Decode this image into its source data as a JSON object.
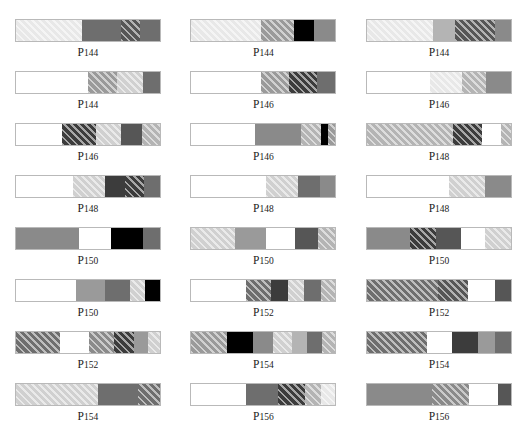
{
  "figure": {
    "corner_mark": "",
    "columns": 3,
    "rows": 8,
    "bar_width_px": 146,
    "bar_height_px": 23
  },
  "palette": {
    "white": "#ffffff",
    "very_light_gray": "#e8e8e8",
    "light_gray": "#d0d0d0",
    "mid_light_gray": "#b4b4b4",
    "mid_gray": "#9a9a9a",
    "gray": "#8a8a8a",
    "dark_gray": "#6e6e6e",
    "darker_gray": "#565656",
    "very_dark_gray": "#3c3c3c",
    "black": "#000000",
    "border": "#b9b9b9",
    "hatch_line": "rgba(255,255,255,0.55)"
  },
  "chart_data": {
    "type": "bar",
    "title": "",
    "xlabel": "",
    "ylabel": "",
    "legend": [],
    "grid": false,
    "items": [
      {
        "label_prefix": "P",
        "label_number": "144",
        "row": 1,
        "col": 1,
        "segments": [
          {
            "width_pct": 46,
            "fill": "very_light_gray",
            "hatch": true
          },
          {
            "width_pct": 27,
            "fill": "dark_gray",
            "hatch": false
          },
          {
            "width_pct": 13,
            "fill": "darker_gray",
            "hatch": true
          },
          {
            "width_pct": 14,
            "fill": "dark_gray",
            "hatch": false
          }
        ]
      },
      {
        "label_prefix": "P",
        "label_number": "144",
        "row": 1,
        "col": 2,
        "segments": [
          {
            "width_pct": 48,
            "fill": "very_light_gray",
            "hatch": true
          },
          {
            "width_pct": 23,
            "fill": "mid_gray",
            "hatch": true
          },
          {
            "width_pct": 14,
            "fill": "black",
            "hatch": false
          },
          {
            "width_pct": 15,
            "fill": "gray",
            "hatch": false
          }
        ]
      },
      {
        "label_prefix": "P",
        "label_number": "144",
        "row": 1,
        "col": 3,
        "segments": [
          {
            "width_pct": 46,
            "fill": "very_light_gray",
            "hatch": true
          },
          {
            "width_pct": 15,
            "fill": "mid_light_gray",
            "hatch": false
          },
          {
            "width_pct": 28,
            "fill": "darker_gray",
            "hatch": true
          },
          {
            "width_pct": 11,
            "fill": "gray",
            "hatch": false
          }
        ]
      },
      {
        "label_prefix": "P",
        "label_number": "144",
        "row": 2,
        "col": 1,
        "segments": [
          {
            "width_pct": 50,
            "fill": "white",
            "hatch": false
          },
          {
            "width_pct": 20,
            "fill": "mid_gray",
            "hatch": true
          },
          {
            "width_pct": 18,
            "fill": "light_gray",
            "hatch": true
          },
          {
            "width_pct": 12,
            "fill": "dark_gray",
            "hatch": false
          }
        ]
      },
      {
        "label_prefix": "P",
        "label_number": "146",
        "row": 2,
        "col": 2,
        "segments": [
          {
            "width_pct": 48,
            "fill": "white",
            "hatch": false
          },
          {
            "width_pct": 20,
            "fill": "mid_gray",
            "hatch": true
          },
          {
            "width_pct": 19,
            "fill": "very_dark_gray",
            "hatch": true
          },
          {
            "width_pct": 13,
            "fill": "dark_gray",
            "hatch": false
          }
        ]
      },
      {
        "label_prefix": "P",
        "label_number": "146",
        "row": 2,
        "col": 3,
        "segments": [
          {
            "width_pct": 44,
            "fill": "white",
            "hatch": false
          },
          {
            "width_pct": 22,
            "fill": "very_light_gray",
            "hatch": true
          },
          {
            "width_pct": 17,
            "fill": "mid_light_gray",
            "hatch": true
          },
          {
            "width_pct": 17,
            "fill": "gray",
            "hatch": false
          }
        ]
      },
      {
        "label_prefix": "P",
        "label_number": "146",
        "row": 3,
        "col": 1,
        "segments": [
          {
            "width_pct": 32,
            "fill": "white",
            "hatch": false
          },
          {
            "width_pct": 24,
            "fill": "very_dark_gray",
            "hatch": true
          },
          {
            "width_pct": 17,
            "fill": "light_gray",
            "hatch": true
          },
          {
            "width_pct": 15,
            "fill": "darker_gray",
            "hatch": false
          },
          {
            "width_pct": 12,
            "fill": "mid_light_gray",
            "hatch": true
          }
        ]
      },
      {
        "label_prefix": "P",
        "label_number": "146",
        "row": 3,
        "col": 2,
        "segments": [
          {
            "width_pct": 44,
            "fill": "white",
            "hatch": false
          },
          {
            "width_pct": 32,
            "fill": "gray",
            "hatch": false
          },
          {
            "width_pct": 14,
            "fill": "mid_light_gray",
            "hatch": true
          },
          {
            "width_pct": 5,
            "fill": "black",
            "hatch": false
          },
          {
            "width_pct": 5,
            "fill": "mid_gray",
            "hatch": true
          }
        ]
      },
      {
        "label_prefix": "P",
        "label_number": "148",
        "row": 3,
        "col": 3,
        "segments": [
          {
            "width_pct": 60,
            "fill": "mid_light_gray",
            "hatch": true
          },
          {
            "width_pct": 20,
            "fill": "very_dark_gray",
            "hatch": true
          },
          {
            "width_pct": 13,
            "fill": "white",
            "hatch": false
          },
          {
            "width_pct": 7,
            "fill": "mid_light_gray",
            "hatch": true
          }
        ]
      },
      {
        "label_prefix": "P",
        "label_number": "148",
        "row": 4,
        "col": 1,
        "segments": [
          {
            "width_pct": 40,
            "fill": "white",
            "hatch": false
          },
          {
            "width_pct": 22,
            "fill": "light_gray",
            "hatch": true
          },
          {
            "width_pct": 14,
            "fill": "very_dark_gray",
            "hatch": false
          },
          {
            "width_pct": 13,
            "fill": "very_dark_gray",
            "hatch": true
          },
          {
            "width_pct": 11,
            "fill": "dark_gray",
            "hatch": false
          }
        ]
      },
      {
        "label_prefix": "P",
        "label_number": "148",
        "row": 4,
        "col": 2,
        "segments": [
          {
            "width_pct": 52,
            "fill": "white",
            "hatch": false
          },
          {
            "width_pct": 22,
            "fill": "light_gray",
            "hatch": true
          },
          {
            "width_pct": 15,
            "fill": "dark_gray",
            "hatch": false
          },
          {
            "width_pct": 11,
            "fill": "gray",
            "hatch": false
          }
        ]
      },
      {
        "label_prefix": "P",
        "label_number": "148",
        "row": 4,
        "col": 3,
        "segments": [
          {
            "width_pct": 57,
            "fill": "white",
            "hatch": false
          },
          {
            "width_pct": 25,
            "fill": "light_gray",
            "hatch": true
          },
          {
            "width_pct": 18,
            "fill": "gray",
            "hatch": false
          }
        ]
      },
      {
        "label_prefix": "P",
        "label_number": "150",
        "row": 5,
        "col": 1,
        "segments": [
          {
            "width_pct": 44,
            "fill": "gray",
            "hatch": false
          },
          {
            "width_pct": 22,
            "fill": "white",
            "hatch": false
          },
          {
            "width_pct": 22,
            "fill": "black",
            "hatch": false
          },
          {
            "width_pct": 12,
            "fill": "dark_gray",
            "hatch": false
          }
        ]
      },
      {
        "label_prefix": "P",
        "label_number": "150",
        "row": 5,
        "col": 2,
        "segments": [
          {
            "width_pct": 30,
            "fill": "light_gray",
            "hatch": true
          },
          {
            "width_pct": 22,
            "fill": "mid_gray",
            "hatch": false
          },
          {
            "width_pct": 20,
            "fill": "white",
            "hatch": false
          },
          {
            "width_pct": 16,
            "fill": "darker_gray",
            "hatch": false
          },
          {
            "width_pct": 12,
            "fill": "mid_light_gray",
            "hatch": true
          }
        ]
      },
      {
        "label_prefix": "P",
        "label_number": "150",
        "row": 5,
        "col": 3,
        "segments": [
          {
            "width_pct": 30,
            "fill": "gray",
            "hatch": false
          },
          {
            "width_pct": 18,
            "fill": "very_dark_gray",
            "hatch": true
          },
          {
            "width_pct": 17,
            "fill": "darker_gray",
            "hatch": false
          },
          {
            "width_pct": 17,
            "fill": "white",
            "hatch": false
          },
          {
            "width_pct": 18,
            "fill": "light_gray",
            "hatch": true
          }
        ]
      },
      {
        "label_prefix": "P",
        "label_number": "150",
        "row": 6,
        "col": 1,
        "segments": [
          {
            "width_pct": 42,
            "fill": "white",
            "hatch": false
          },
          {
            "width_pct": 20,
            "fill": "mid_gray",
            "hatch": false
          },
          {
            "width_pct": 17,
            "fill": "dark_gray",
            "hatch": false
          },
          {
            "width_pct": 11,
            "fill": "light_gray",
            "hatch": true
          },
          {
            "width_pct": 10,
            "fill": "black",
            "hatch": false
          }
        ]
      },
      {
        "label_prefix": "P",
        "label_number": "152",
        "row": 6,
        "col": 2,
        "segments": [
          {
            "width_pct": 38,
            "fill": "white",
            "hatch": false
          },
          {
            "width_pct": 17,
            "fill": "dark_gray",
            "hatch": true
          },
          {
            "width_pct": 12,
            "fill": "very_dark_gray",
            "hatch": false
          },
          {
            "width_pct": 11,
            "fill": "light_gray",
            "hatch": true
          },
          {
            "width_pct": 12,
            "fill": "dark_gray",
            "hatch": false
          },
          {
            "width_pct": 10,
            "fill": "mid_light_gray",
            "hatch": true
          }
        ]
      },
      {
        "label_prefix": "P",
        "label_number": "152",
        "row": 6,
        "col": 3,
        "segments": [
          {
            "width_pct": 49,
            "fill": "dark_gray",
            "hatch": true
          },
          {
            "width_pct": 21,
            "fill": "darker_gray",
            "hatch": true
          },
          {
            "width_pct": 19,
            "fill": "white",
            "hatch": false
          },
          {
            "width_pct": 11,
            "fill": "darker_gray",
            "hatch": false
          }
        ]
      },
      {
        "label_prefix": "P",
        "label_number": "152",
        "row": 7,
        "col": 1,
        "segments": [
          {
            "width_pct": 31,
            "fill": "dark_gray",
            "hatch": true
          },
          {
            "width_pct": 20,
            "fill": "white",
            "hatch": false
          },
          {
            "width_pct": 17,
            "fill": "gray",
            "hatch": true
          },
          {
            "width_pct": 14,
            "fill": "very_dark_gray",
            "hatch": true
          },
          {
            "width_pct": 10,
            "fill": "mid_gray",
            "hatch": false
          },
          {
            "width_pct": 8,
            "fill": "light_gray",
            "hatch": true
          }
        ]
      },
      {
        "label_prefix": "P",
        "label_number": "154",
        "row": 7,
        "col": 2,
        "segments": [
          {
            "width_pct": 25,
            "fill": "mid_gray",
            "hatch": true
          },
          {
            "width_pct": 18,
            "fill": "black",
            "hatch": false
          },
          {
            "width_pct": 14,
            "fill": "gray",
            "hatch": false
          },
          {
            "width_pct": 13,
            "fill": "light_gray",
            "hatch": true
          },
          {
            "width_pct": 10,
            "fill": "mid_light_gray",
            "hatch": false
          },
          {
            "width_pct": 11,
            "fill": "dark_gray",
            "hatch": false
          },
          {
            "width_pct": 9,
            "fill": "mid_light_gray",
            "hatch": true
          }
        ]
      },
      {
        "label_prefix": "P",
        "label_number": "154",
        "row": 7,
        "col": 3,
        "segments": [
          {
            "width_pct": 42,
            "fill": "dark_gray",
            "hatch": true
          },
          {
            "width_pct": 17,
            "fill": "white",
            "hatch": false
          },
          {
            "width_pct": 18,
            "fill": "very_dark_gray",
            "hatch": false
          },
          {
            "width_pct": 12,
            "fill": "mid_gray",
            "hatch": false
          },
          {
            "width_pct": 11,
            "fill": "dark_gray",
            "hatch": false
          }
        ]
      },
      {
        "label_prefix": "P",
        "label_number": "154",
        "row": 8,
        "col": 1,
        "segments": [
          {
            "width_pct": 57,
            "fill": "light_gray",
            "hatch": true
          },
          {
            "width_pct": 28,
            "fill": "dark_gray",
            "hatch": false
          },
          {
            "width_pct": 15,
            "fill": "dark_gray",
            "hatch": true
          }
        ]
      },
      {
        "label_prefix": "P",
        "label_number": "156",
        "row": 8,
        "col": 2,
        "segments": [
          {
            "width_pct": 38,
            "fill": "white",
            "hatch": false
          },
          {
            "width_pct": 22,
            "fill": "dark_gray",
            "hatch": false
          },
          {
            "width_pct": 19,
            "fill": "very_dark_gray",
            "hatch": true
          },
          {
            "width_pct": 11,
            "fill": "mid_light_gray",
            "hatch": true
          },
          {
            "width_pct": 10,
            "fill": "very_light_gray",
            "hatch": true
          }
        ]
      },
      {
        "label_prefix": "P",
        "label_number": "156",
        "row": 8,
        "col": 3,
        "segments": [
          {
            "width_pct": 45,
            "fill": "gray",
            "hatch": false
          },
          {
            "width_pct": 26,
            "fill": "gray",
            "hatch": true
          },
          {
            "width_pct": 20,
            "fill": "white",
            "hatch": false
          },
          {
            "width_pct": 9,
            "fill": "darker_gray",
            "hatch": false
          }
        ]
      }
    ]
  }
}
